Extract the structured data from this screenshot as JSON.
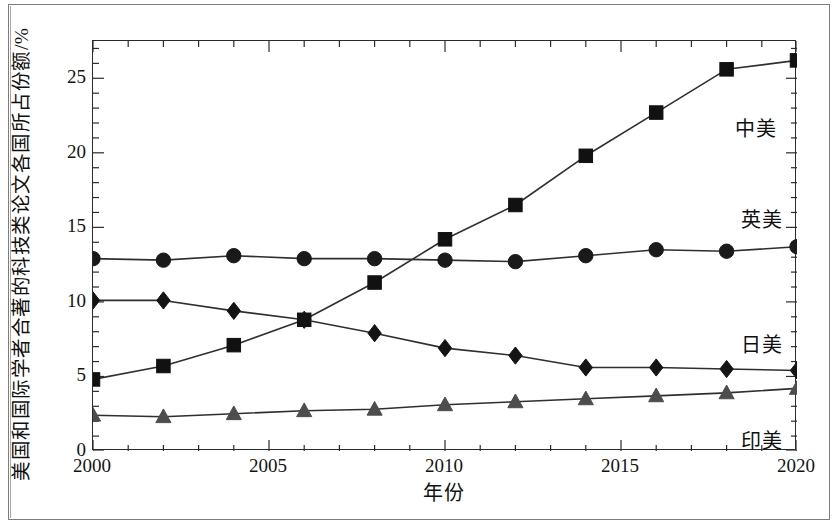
{
  "chart_data": {
    "type": "line",
    "title": "",
    "xlabel": "年份",
    "ylabel": "美国和国际学者合著的科技类论文各国所占份额/%",
    "x": [
      2000,
      2002,
      2004,
      2006,
      2008,
      2010,
      2012,
      2014,
      2016,
      2018,
      2020
    ],
    "xlim": [
      2000,
      2020
    ],
    "ylim": [
      0,
      27.5
    ],
    "xticks": [
      "2000",
      "2005",
      "2010",
      "2015",
      "2020"
    ],
    "xtick_values": [
      2000,
      2005,
      2010,
      2015,
      2020
    ],
    "yticks": [
      "0",
      "5",
      "10",
      "15",
      "20",
      "25"
    ],
    "ytick_values": [
      0,
      5,
      10,
      15,
      20,
      25
    ],
    "grid": false,
    "legend_position": "inline-right-annotations",
    "series": [
      {
        "name": "中美",
        "marker": "square",
        "color": "#111111",
        "values": [
          4.8,
          5.7,
          7.1,
          8.8,
          11.3,
          14.2,
          16.5,
          19.8,
          22.7,
          25.6,
          26.2
        ]
      },
      {
        "name": "英美",
        "marker": "circle",
        "color": "#1a1a1a",
        "values": [
          12.9,
          12.8,
          13.1,
          12.9,
          12.9,
          12.8,
          12.7,
          13.1,
          13.5,
          13.4,
          13.7
        ]
      },
      {
        "name": "日美",
        "marker": "diamond",
        "color": "#141414",
        "values": [
          10.1,
          10.1,
          9.4,
          8.8,
          7.9,
          6.9,
          6.4,
          5.6,
          5.6,
          5.5,
          5.4
        ]
      },
      {
        "name": "印美",
        "marker": "triangle",
        "color": "#4d4d4d",
        "values": [
          2.4,
          2.3,
          2.5,
          2.7,
          2.8,
          3.1,
          3.3,
          3.5,
          3.7,
          3.9,
          4.2
        ]
      }
    ],
    "annotations": [
      {
        "text": "中美",
        "x_px": 735,
        "y_px": 118
      },
      {
        "text": "英美",
        "x_px": 741,
        "y_px": 209
      },
      {
        "text": "日美",
        "x_px": 741,
        "y_px": 334
      },
      {
        "text": "印美",
        "x_px": 741,
        "y_px": 430
      }
    ]
  },
  "axes": {
    "y_title": "美国和国际学者合著的科技类论文各国所占份额/%",
    "x_title": "年份",
    "y_tick_labels": [
      "25",
      "20",
      "15",
      "10",
      "5",
      "0"
    ],
    "x_tick_labels": [
      "2000",
      "2005",
      "2010",
      "2015",
      "2020"
    ]
  }
}
